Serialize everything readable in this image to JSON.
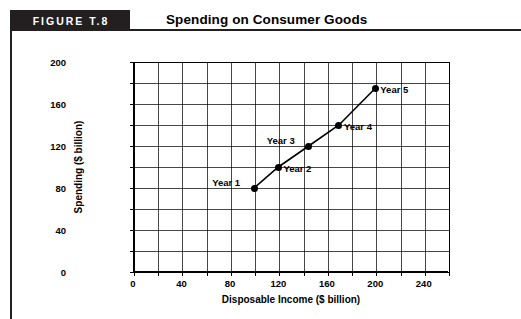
{
  "figure": {
    "tag": "FIGURE T.8",
    "title": "Spending on Consumer Goods"
  },
  "chart_data": {
    "type": "line",
    "title": "Spending on Consumer Goods",
    "xlabel": "Disposable Income ($ billion)",
    "ylabel": "Spending ($ billion)",
    "xlim": [
      0,
      260
    ],
    "ylim": [
      0,
      200
    ],
    "xticks": [
      0,
      40,
      80,
      120,
      160,
      200,
      240
    ],
    "yticks": [
      0,
      40,
      80,
      120,
      160,
      200
    ],
    "xtick_labels": [
      "0",
      "40",
      "80",
      "120",
      "160",
      "200",
      "240"
    ],
    "ytick_labels": [
      "0",
      "40",
      "80",
      "120",
      "160",
      "200"
    ],
    "x_minor_step": 20,
    "y_minor_step": 20,
    "grid": true,
    "legend": "none",
    "series": [
      {
        "name": "Consumption function",
        "x": [
          100,
          120,
          145,
          170,
          200
        ],
        "y": [
          80,
          100,
          120,
          140,
          175
        ],
        "point_labels": [
          "Year 1",
          "Year 2",
          "Year 3",
          "Year 4",
          "Year 5"
        ]
      }
    ],
    "annotations": [
      {
        "text": "Year 1",
        "x": 100,
        "y": 80,
        "placement": "left"
      },
      {
        "text": "Year 2",
        "x": 120,
        "y": 100,
        "placement": "right"
      },
      {
        "text": "Year 3",
        "x": 145,
        "y": 120,
        "placement": "left"
      },
      {
        "text": "Year 4",
        "x": 170,
        "y": 140,
        "placement": "right"
      },
      {
        "text": "Year 5",
        "x": 200,
        "y": 175,
        "placement": "right"
      }
    ]
  },
  "colors": {
    "ink": "#000000",
    "tagBackground": "#231f20",
    "tagText": "#ffffff",
    "background": "#ffffff"
  }
}
